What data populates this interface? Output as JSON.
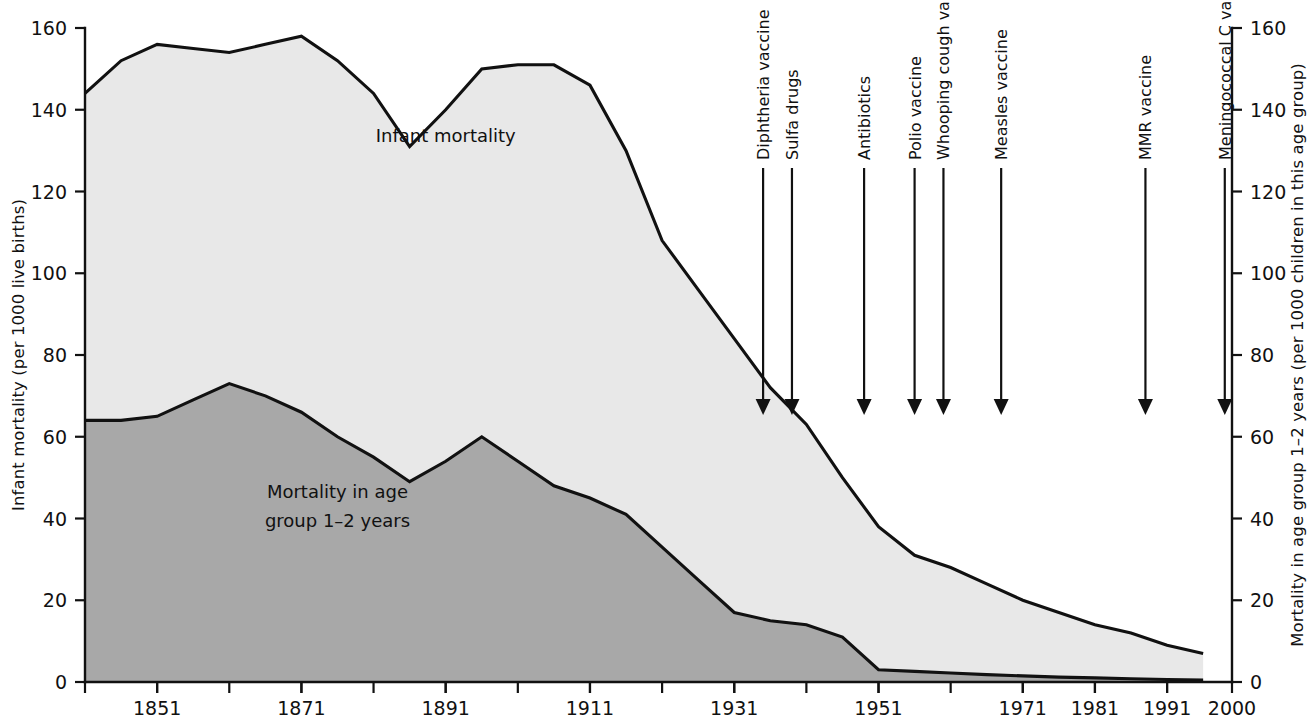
{
  "chart_data": {
    "type": "area",
    "title": "",
    "xlabel": "",
    "ylabel": "Infant mortality (per 1000 live births)",
    "y2label": "Mortality in age group 1–2 years (per 1000 children in this age group)",
    "xlim": [
      1841,
      2000
    ],
    "ylim": [
      0,
      160
    ],
    "y2lim": [
      0,
      160
    ],
    "grid": false,
    "legend": "inline-labels",
    "x_ticks": [
      1851,
      1871,
      1891,
      1911,
      1931,
      1951,
      1971,
      1981,
      1991,
      2000
    ],
    "x_tick_labels": [
      "1851",
      "1871",
      "1891",
      "1911",
      "1931",
      "1951",
      "1971",
      "1981",
      "1991",
      "2000"
    ],
    "x_minor_tick_step": 10,
    "y_ticks": [
      0,
      20,
      40,
      60,
      80,
      100,
      120,
      140,
      160
    ],
    "y_tick_labels": [
      "0",
      "20",
      "40",
      "60",
      "80",
      "100",
      "120",
      "140",
      "160"
    ],
    "y2_ticks": [
      0,
      20,
      40,
      60,
      80,
      100,
      120,
      140,
      160
    ],
    "y2_tick_labels": [
      "0",
      "20",
      "40",
      "60",
      "80",
      "100",
      "120",
      "140",
      "160"
    ],
    "series": [
      {
        "name": "Infant mortality",
        "fill_color": "#e8e8e8",
        "line_color": "#111111",
        "x": [
          1841,
          1846,
          1851,
          1856,
          1861,
          1866,
          1871,
          1876,
          1881,
          1886,
          1891,
          1896,
          1901,
          1906,
          1911,
          1916,
          1921,
          1926,
          1931,
          1936,
          1941,
          1946,
          1951,
          1956,
          1961,
          1966,
          1971,
          1976,
          1981,
          1986,
          1991,
          1996
        ],
        "values": [
          144,
          152,
          156,
          155,
          154,
          156,
          158,
          152,
          144,
          131,
          140,
          150,
          151,
          151,
          146,
          130,
          108,
          96,
          84,
          72,
          63,
          50,
          38,
          31,
          28,
          24,
          20,
          17,
          14,
          12,
          9,
          7
        ]
      },
      {
        "name": "Mortality in age group 1–2 years",
        "fill_color": "#a8a8a8",
        "line_color": "#111111",
        "x": [
          1841,
          1846,
          1851,
          1856,
          1861,
          1866,
          1871,
          1876,
          1881,
          1886,
          1891,
          1896,
          1901,
          1906,
          1911,
          1916,
          1921,
          1926,
          1931,
          1936,
          1941,
          1946,
          1951,
          1956,
          1961,
          1966,
          1971,
          1976,
          1981,
          1986,
          1991,
          1996
        ],
        "values": [
          64,
          64,
          65,
          69,
          73,
          70,
          66,
          60,
          55,
          49,
          54,
          60,
          54,
          48,
          45,
          41,
          33,
          25,
          17,
          15,
          14,
          11,
          3,
          2.6,
          2.2,
          1.8,
          1.5,
          1.2,
          1.0,
          0.8,
          0.6,
          0.5
        ]
      }
    ],
    "series_inline_labels": [
      {
        "text": "Infant mortality",
        "x": 1891,
        "y": 132
      },
      {
        "text": "Mortality in age",
        "x": 1876,
        "y": 45
      },
      {
        "text": "group 1–2 years",
        "x": 1876,
        "y": 38
      }
    ],
    "annotations": [
      {
        "label": "Diphtheria vaccine",
        "year": 1935,
        "label_top": 130
      },
      {
        "label": "Sulfa drugs",
        "year": 1939,
        "label_top": 130
      },
      {
        "label": "Antibiotics",
        "year": 1949,
        "label_top": 130
      },
      {
        "label": "Polio vaccine",
        "year": 1956,
        "label_top": 130
      },
      {
        "label": "Whooping cough vaccine",
        "year": 1960,
        "label_top": 130
      },
      {
        "label": "Measles vaccine",
        "year": 1968,
        "label_top": 130
      },
      {
        "label": "MMR vaccine",
        "year": 1988,
        "label_top": 130
      },
      {
        "label": "Meningococcal C vaccine",
        "year": 1999,
        "label_top": 130
      }
    ]
  },
  "colors": {
    "infant_fill": "#e8e8e8",
    "age_group_fill": "#a8a8a8",
    "ink": "#111111",
    "background": "#ffffff"
  }
}
